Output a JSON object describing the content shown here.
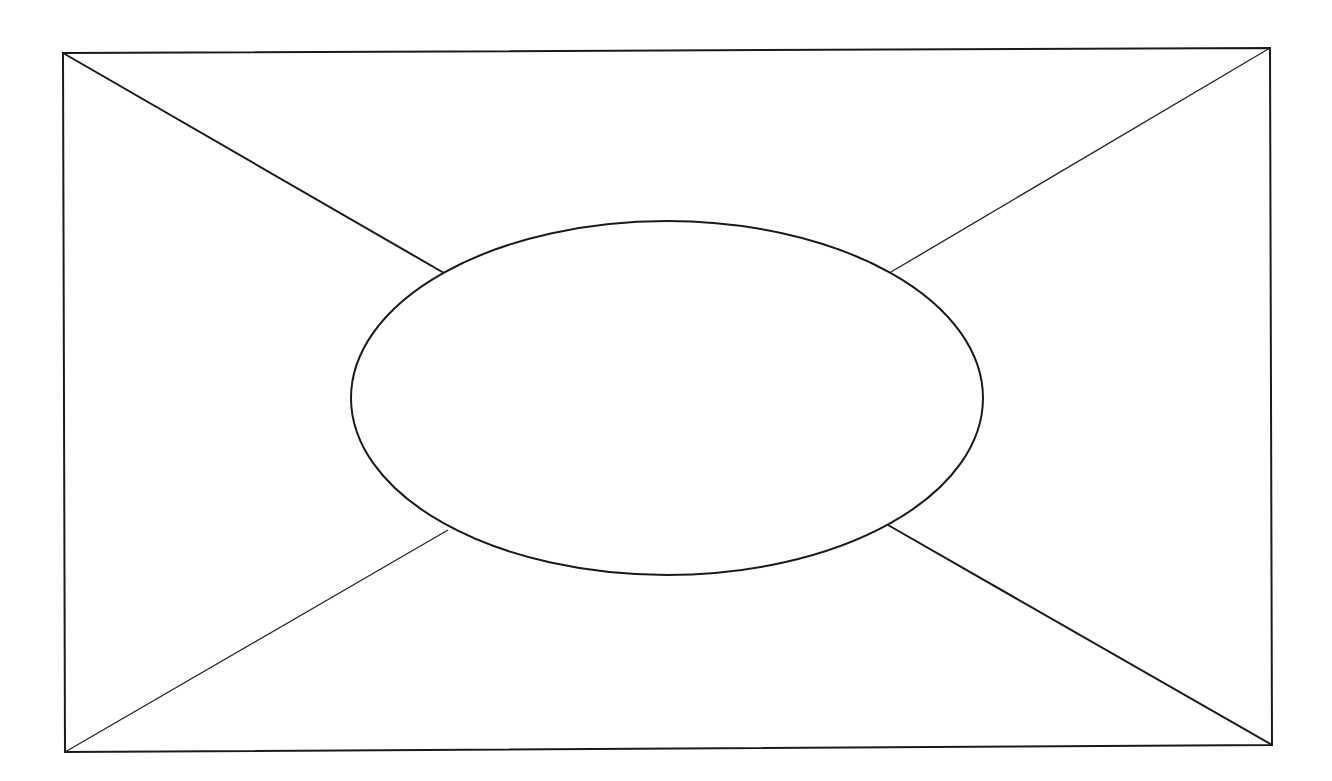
{
  "diagram": {
    "type": "wireframe-placeholder",
    "colors": {
      "background": "#ffffff",
      "line": "#1a1a1a"
    },
    "frame": {
      "corners": {
        "top_left": [
          63,
          53
        ],
        "top_right": [
          1270,
          48
        ],
        "bottom_right": [
          1272,
          745
        ],
        "bottom_left": [
          65,
          752
        ]
      }
    },
    "ellipse": {
      "cx": 667,
      "cy": 398,
      "rx": 316,
      "ry": 177
    },
    "diagonals": [
      {
        "name": "top-left",
        "from": [
          63,
          53
        ],
        "to": [
          444,
          273
        ]
      },
      {
        "name": "top-right",
        "from": [
          1270,
          48
        ],
        "to": [
          891,
          272
        ]
      },
      {
        "name": "bottom-left",
        "from": [
          65,
          752
        ],
        "to": [
          448,
          530
        ]
      },
      {
        "name": "bottom-right",
        "from": [
          1272,
          745
        ],
        "to": [
          888,
          525
        ]
      }
    ]
  }
}
